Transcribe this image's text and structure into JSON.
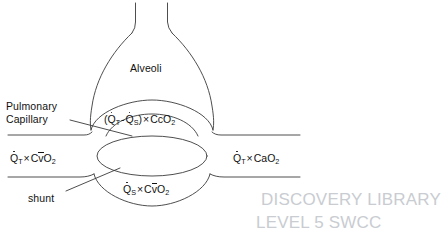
{
  "diagram": {
    "stroke_color": "#3a3a3a",
    "text_color": "#111111",
    "background_color": "#ffffff",
    "labels": {
      "alveoli": "Alveoli",
      "pulmonary_capillary": "Pulmonary Capillary",
      "shunt": "shunt"
    },
    "formulas": {
      "capillary_flow": {
        "full_text": "(Q̇T - Q̇S) × CcO2",
        "open_paren": "(",
        "q_total": "Q",
        "q_total_sub": "T",
        "minus": "-",
        "q_shunt": "Q",
        "q_shunt_sub": "S",
        "close_paren": ")",
        "times": "×",
        "content": "CcO",
        "content_sub": "2"
      },
      "venous_inflow": {
        "full_text": "Q̇T × Cv̄O2",
        "q": "Q",
        "q_sub": "T",
        "times": "×",
        "content_pre": "C",
        "content_bar": "v",
        "content_post": "O",
        "content_sub": "2"
      },
      "arterial_outflow": {
        "full_text": "Q̇T × CaO2",
        "q": "Q",
        "q_sub": "T",
        "times": "×",
        "content": "CaO",
        "content_sub": "2"
      },
      "shunt_flow": {
        "full_text": "Q̇S × Cv̄O2",
        "q": "Q",
        "q_sub": "S",
        "times": "×",
        "content_pre": "C",
        "content_bar": "v",
        "content_post": "O",
        "content_sub": "2"
      }
    },
    "watermark": {
      "line1": "DISCOVERY LIBRARY",
      "line2": "LEVEL 5 SWCC",
      "bottom_strip": ""
    }
  }
}
